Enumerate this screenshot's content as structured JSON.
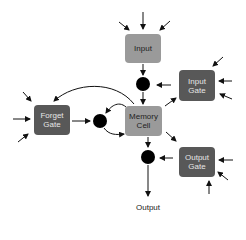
{
  "diagram": {
    "nodes": {
      "input": {
        "label": "Input",
        "color": "#9a9a9a"
      },
      "input_gate": {
        "label": "Input\nGate",
        "line1": "Input",
        "line2": "Gate",
        "color": "#585858"
      },
      "forget_gate": {
        "line1": "Forget",
        "line2": "Gate",
        "color": "#585858"
      },
      "memory_cell": {
        "line1": "Memory",
        "line2": "Cell",
        "color": "#9a9a9a"
      },
      "output_gate": {
        "line1": "Output",
        "line2": "Gate",
        "color": "#585858"
      },
      "output": {
        "label": "Output"
      }
    },
    "multiply_nodes": [
      "input-multiply",
      "forget-multiply",
      "output-multiply"
    ]
  }
}
